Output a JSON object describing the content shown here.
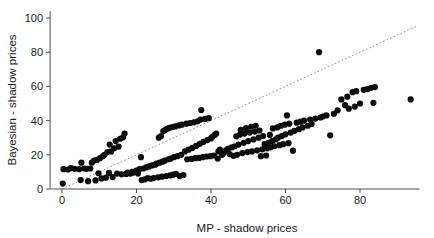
{
  "chart_data": {
    "type": "scatter",
    "title": "",
    "subtitle": "",
    "xlabel": "MP - shadow prices",
    "ylabel": "Bayesian - shadow prices",
    "xlim": [
      -3,
      96
    ],
    "ylim": [
      -3,
      104
    ],
    "xticks": [
      0,
      20,
      40,
      60,
      80
    ],
    "yticks": [
      0,
      20,
      40,
      60,
      80,
      100
    ],
    "xtick_labels": [
      "0",
      "20",
      "40",
      "60",
      "80"
    ],
    "ytick_labels": [
      "0",
      "20",
      "40",
      "60",
      "80",
      "100"
    ],
    "grid": false,
    "legend": "none",
    "marker": "filled-circle",
    "marker_color": "#0d0d0d",
    "marker_size": 3.1,
    "annotations": [
      {
        "name": "identity-reference-line",
        "type": "line",
        "style": "dotted",
        "color": "#8c8c8c",
        "x0": 0,
        "y0": 0,
        "x1": 95,
        "y1": 95,
        "description": "y = x diagonal reference line"
      },
      {
        "name": "high-outlier",
        "type": "point",
        "x": 69,
        "y": 80,
        "description": "isolated point far above the main band"
      }
    ],
    "series": [
      {
        "name": "shadow prices",
        "points": [
          [
            0.2,
            3.2
          ],
          [
            0.4,
            11.6
          ],
          [
            1.6,
            11.4
          ],
          [
            2.4,
            12.2
          ],
          [
            3.4,
            11.8
          ],
          [
            4.6,
            11.6
          ],
          [
            5.0,
            5.2
          ],
          [
            5.2,
            15.4
          ],
          [
            6.0,
            12.0
          ],
          [
            6.6,
            11.8
          ],
          [
            7.0,
            4.6
          ],
          [
            7.6,
            12.0
          ],
          [
            8.0,
            15.4
          ],
          [
            8.6,
            16.6
          ],
          [
            9.0,
            5.0
          ],
          [
            9.4,
            17.0
          ],
          [
            9.8,
            9.2
          ],
          [
            10.2,
            18.0
          ],
          [
            10.6,
            6.2
          ],
          [
            11.0,
            19.2
          ],
          [
            11.4,
            20.0
          ],
          [
            11.8,
            6.6
          ],
          [
            12.2,
            21.6
          ],
          [
            12.6,
            9.4
          ],
          [
            12.8,
            26.0
          ],
          [
            13.2,
            22.0
          ],
          [
            13.6,
            7.0
          ],
          [
            14.0,
            23.8
          ],
          [
            14.4,
            28.0
          ],
          [
            14.8,
            9.0
          ],
          [
            15.2,
            24.8
          ],
          [
            15.6,
            29.4
          ],
          [
            16.0,
            8.6
          ],
          [
            16.4,
            30.2
          ],
          [
            16.8,
            32.4
          ],
          [
            17.2,
            8.8
          ],
          [
            17.6,
            9.6
          ],
          [
            18.0,
            9.2
          ],
          [
            18.4,
            9.0
          ],
          [
            18.8,
            10.0
          ],
          [
            19.2,
            9.6
          ],
          [
            19.6,
            10.2
          ],
          [
            20.0,
            10.8
          ],
          [
            20.4,
            9.0
          ],
          [
            20.8,
            11.6
          ],
          [
            21.2,
            18.6
          ],
          [
            21.4,
            5.2
          ],
          [
            21.8,
            12.0
          ],
          [
            22.2,
            5.6
          ],
          [
            22.6,
            12.6
          ],
          [
            23.0,
            6.4
          ],
          [
            23.4,
            13.2
          ],
          [
            23.8,
            6.0
          ],
          [
            24.2,
            13.8
          ],
          [
            24.6,
            6.4
          ],
          [
            25.0,
            14.2
          ],
          [
            25.4,
            14.8
          ],
          [
            25.8,
            6.8
          ],
          [
            26.0,
            30.0
          ],
          [
            26.2,
            15.4
          ],
          [
            26.6,
            31.0
          ],
          [
            26.8,
            7.2
          ],
          [
            27.0,
            16.0
          ],
          [
            27.2,
            33.8
          ],
          [
            27.6,
            16.6
          ],
          [
            27.8,
            34.6
          ],
          [
            28.0,
            7.6
          ],
          [
            28.2,
            35.2
          ],
          [
            28.6,
            17.4
          ],
          [
            28.8,
            35.8
          ],
          [
            29.0,
            8.0
          ],
          [
            29.2,
            17.8
          ],
          [
            29.6,
            36.2
          ],
          [
            29.8,
            8.4
          ],
          [
            30.0,
            18.6
          ],
          [
            30.4,
            36.6
          ],
          [
            30.6,
            8.8
          ],
          [
            31.0,
            19.2
          ],
          [
            31.4,
            37.2
          ],
          [
            31.6,
            7.6
          ],
          [
            32.0,
            20.0
          ],
          [
            32.2,
            37.6
          ],
          [
            32.6,
            8.2
          ],
          [
            33.0,
            22.0
          ],
          [
            33.4,
            38.2
          ],
          [
            33.6,
            17.4
          ],
          [
            34.0,
            23.0
          ],
          [
            34.4,
            38.6
          ],
          [
            34.8,
            17.6
          ],
          [
            35.0,
            24.0
          ],
          [
            35.4,
            39.0
          ],
          [
            35.8,
            18.0
          ],
          [
            36.0,
            25.2
          ],
          [
            36.4,
            39.6
          ],
          [
            36.8,
            18.2
          ],
          [
            37.0,
            26.4
          ],
          [
            37.2,
            40.6
          ],
          [
            37.4,
            46.2
          ],
          [
            37.8,
            18.6
          ],
          [
            38.0,
            27.6
          ],
          [
            38.4,
            41.0
          ],
          [
            38.8,
            19.0
          ],
          [
            39.0,
            28.6
          ],
          [
            39.4,
            41.4
          ],
          [
            39.8,
            19.2
          ],
          [
            40.0,
            29.6
          ],
          [
            40.4,
            30.6
          ],
          [
            40.8,
            19.6
          ],
          [
            41.0,
            31.6
          ],
          [
            41.4,
            32.4
          ],
          [
            41.8,
            17.8
          ],
          [
            42.0,
            22.0
          ],
          [
            42.4,
            23.0
          ],
          [
            43.0,
            20.0
          ],
          [
            43.4,
            21.0
          ],
          [
            44.0,
            22.6
          ],
          [
            44.6,
            23.6
          ],
          [
            45.0,
            20.4
          ],
          [
            45.6,
            24.4
          ],
          [
            46.0,
            19.4
          ],
          [
            46.4,
            25.0
          ],
          [
            46.8,
            30.8
          ],
          [
            47.0,
            20.0
          ],
          [
            47.4,
            26.0
          ],
          [
            47.8,
            31.8
          ],
          [
            48.0,
            34.6
          ],
          [
            48.4,
            21.0
          ],
          [
            48.8,
            27.0
          ],
          [
            49.0,
            32.4
          ],
          [
            49.4,
            35.6
          ],
          [
            49.8,
            21.6
          ],
          [
            50.0,
            28.0
          ],
          [
            50.4,
            33.0
          ],
          [
            50.8,
            36.4
          ],
          [
            51.0,
            22.0
          ],
          [
            51.4,
            29.0
          ],
          [
            51.8,
            33.6
          ],
          [
            52.0,
            37.0
          ],
          [
            52.4,
            22.6
          ],
          [
            52.8,
            30.0
          ],
          [
            53.0,
            34.2
          ],
          [
            53.4,
            19.2
          ],
          [
            53.8,
            23.2
          ],
          [
            54.0,
            31.0
          ],
          [
            54.4,
            26.2
          ],
          [
            54.8,
            19.6
          ],
          [
            55.0,
            23.8
          ],
          [
            55.4,
            27.0
          ],
          [
            55.8,
            31.6
          ],
          [
            56.0,
            24.4
          ],
          [
            56.4,
            28.0
          ],
          [
            56.6,
            35.4
          ],
          [
            57.0,
            25.0
          ],
          [
            57.4,
            29.0
          ],
          [
            57.8,
            36.0
          ],
          [
            58.0,
            30.0
          ],
          [
            58.4,
            25.6
          ],
          [
            58.8,
            37.0
          ],
          [
            59.0,
            31.0
          ],
          [
            59.4,
            26.2
          ],
          [
            59.8,
            37.6
          ],
          [
            60.0,
            32.0
          ],
          [
            60.4,
            43.0
          ],
          [
            60.8,
            26.8
          ],
          [
            61.0,
            38.2
          ],
          [
            61.4,
            33.0
          ],
          [
            62.0,
            22.4
          ],
          [
            62.4,
            34.0
          ],
          [
            63.0,
            38.8
          ],
          [
            63.6,
            35.0
          ],
          [
            64.0,
            39.4
          ],
          [
            64.6,
            36.0
          ],
          [
            65.0,
            40.0
          ],
          [
            66.0,
            37.0
          ],
          [
            66.6,
            40.6
          ],
          [
            67.0,
            38.0
          ],
          [
            68.0,
            41.2
          ],
          [
            69.0,
            80.0
          ],
          [
            69.4,
            41.8
          ],
          [
            70.0,
            42.4
          ],
          [
            71.0,
            43.0
          ],
          [
            72.0,
            31.4
          ],
          [
            73.0,
            44.0
          ],
          [
            74.0,
            46.0
          ],
          [
            75.0,
            52.4
          ],
          [
            76.0,
            49.0
          ],
          [
            76.6,
            54.0
          ],
          [
            77.0,
            47.0
          ],
          [
            78.0,
            56.6
          ],
          [
            78.6,
            48.2
          ],
          [
            79.0,
            57.2
          ],
          [
            80.0,
            50.0
          ],
          [
            81.0,
            58.0
          ],
          [
            82.0,
            58.4
          ],
          [
            83.0,
            59.2
          ],
          [
            83.6,
            50.4
          ],
          [
            84.0,
            59.6
          ],
          [
            93.6,
            52.4
          ]
        ]
      }
    ]
  },
  "axes": {
    "x_axis_name": "MP - shadow prices",
    "y_axis_name": "Bayesian - shadow prices"
  }
}
